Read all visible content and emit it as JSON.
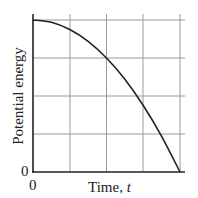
{
  "chart_data": {
    "type": "line",
    "title": "",
    "xlabel": "Time, t",
    "ylabel": "Potential energy",
    "x_tick_labels": [
      "0"
    ],
    "y_tick_labels": [
      "0"
    ],
    "xlim": [
      0,
      4
    ],
    "ylim": [
      0,
      4
    ],
    "grid": true,
    "grid_divisions": {
      "x": 4,
      "y": 4
    },
    "legend": null,
    "series": [
      {
        "name": "Potential energy",
        "x": [
          0,
          0.5,
          1,
          1.5,
          2,
          2.5,
          3,
          3.5,
          4
        ],
        "y": [
          4,
          3.94,
          3.75,
          3.44,
          3,
          2.44,
          1.75,
          0.94,
          0
        ]
      }
    ],
    "colors": {
      "curve": "#222222",
      "grid": "#9a9a9a",
      "axis": "#222222"
    }
  },
  "labels": {
    "ylabel": "Potential energy",
    "xlabel_text": "Time, ",
    "xlabel_var": "t",
    "x_zero": "0",
    "y_zero": "0"
  }
}
